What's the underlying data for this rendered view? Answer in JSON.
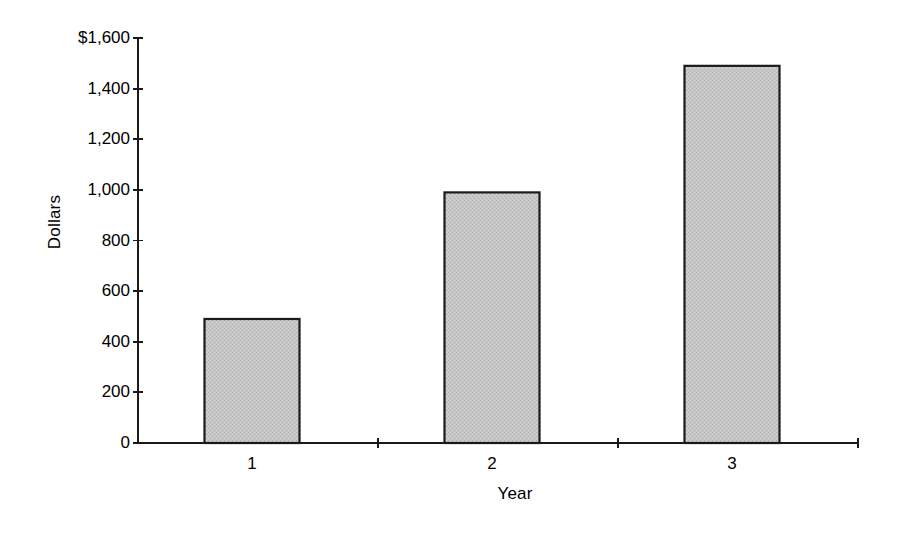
{
  "chart_data": {
    "type": "bar",
    "title": "",
    "subtitle": "",
    "xlabel": "Year",
    "ylabel": "Dollars",
    "categories": [
      "1",
      "2",
      "3"
    ],
    "values": [
      490,
      990,
      1490
    ],
    "series": [
      {
        "name": "Dollars",
        "values": [
          490,
          990,
          1490
        ]
      }
    ],
    "ylim": [
      0,
      1600
    ],
    "xlim": [
      0,
      3
    ],
    "y_ticks": [
      0,
      200,
      400,
      600,
      800,
      1000,
      1200,
      1400,
      1600
    ],
    "y_tick_labels": [
      "0",
      "200",
      "400",
      "600",
      "800",
      "1,000",
      "1,200",
      "1,400",
      "$1,600"
    ],
    "x_tick_labels": [
      "1",
      "2",
      "3"
    ],
    "grid": false,
    "legend": false,
    "legend_position": "none",
    "annotations": [],
    "colors": {
      "bar_fill": "#c3c3c3",
      "bar_stroke": "#1a1a1a",
      "axis": "#1a1a1a",
      "text": "#000000",
      "background": "#ffffff"
    }
  },
  "axes": {
    "y_title": "Dollars",
    "x_title": "Year"
  }
}
